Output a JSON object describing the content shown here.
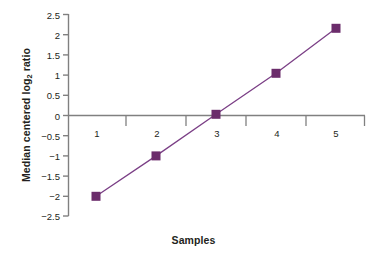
{
  "chart_data": {
    "type": "line",
    "title": "",
    "xlabel": "Samples",
    "ylabel_html": "Median centered log<sub>2</sub> ratio",
    "ylabel_text": "Median centered log2 ratio",
    "categories": [
      "1",
      "2",
      "3",
      "4",
      "5"
    ],
    "values": [
      -2.0,
      -1.0,
      0.03,
      1.03,
      2.05
    ],
    "series": [
      {
        "name": "Median centered log2 ratio",
        "values": [
          -2.0,
          -1.0,
          0.03,
          1.03,
          2.05
        ],
        "color": "#6B2C6B",
        "marker": "square"
      }
    ],
    "ylim": [
      -2.5,
      2.5
    ],
    "yticks": [
      "2.5",
      "2",
      "1.5",
      "1",
      "0.5",
      "0",
      "−0.5",
      "−1",
      "−1.5",
      "−2",
      "−2.5"
    ],
    "ytick_values": [
      2.5,
      2,
      1.5,
      1,
      0.5,
      0,
      -0.5,
      -1,
      -1.5,
      -2,
      -2.5
    ],
    "xticks": [
      "1",
      "2",
      "3",
      "4",
      "5"
    ],
    "grid": false,
    "legend": "none",
    "axis_color": "#808080",
    "text_color": "#231f20",
    "series_color": "#6B2C6B"
  }
}
